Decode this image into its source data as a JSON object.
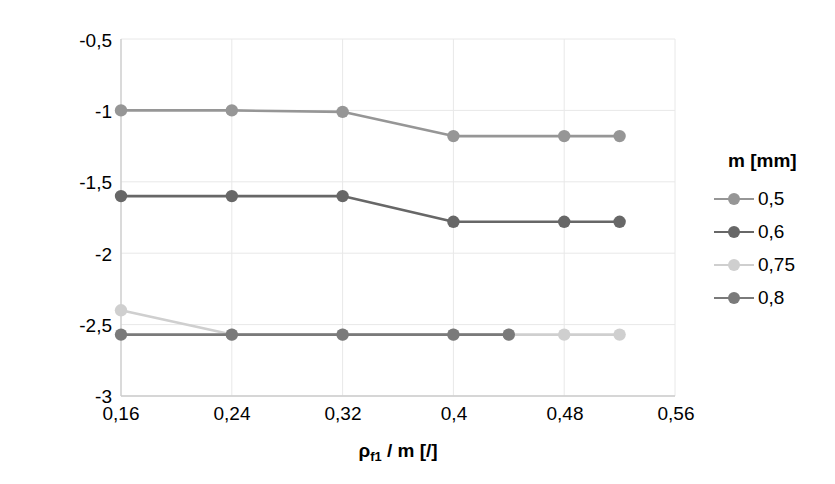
{
  "chart_data": {
    "type": "line",
    "title": "",
    "xlabel": "ρf1 / m [/]",
    "ylabel": "zσGEHMax - zNK [mm]",
    "xlabel_parts": {
      "rho": "ρ",
      "sub": "f1",
      "rest": " / m [/]"
    },
    "ylabel_parts": {
      "z1": "z",
      "sub1": "σGEHMax",
      "dash": " - ",
      "z2": "z",
      "sub2": "NK",
      "unit": " [mm]"
    },
    "xlim": [
      0.16,
      0.56
    ],
    "ylim": [
      -3,
      -0.5
    ],
    "xticks": [
      "0,16",
      "0,24",
      "0,32",
      "0,4",
      "0,48",
      "0,56"
    ],
    "xtick_values": [
      0.16,
      0.24,
      0.32,
      0.4,
      0.48,
      0.56
    ],
    "yticks": [
      "-0,5",
      "-1",
      "-1,5",
      "-2",
      "-2,5",
      "-3"
    ],
    "ytick_values": [
      -0.5,
      -1,
      -1.5,
      -2,
      -2.5,
      -3
    ],
    "grid": true,
    "legend_position": "right",
    "legend_title": "m [mm]",
    "series": [
      {
        "name": "0,5",
        "color": "#969696",
        "x": [
          0.16,
          0.24,
          0.32,
          0.4,
          0.48,
          0.52
        ],
        "values": [
          -1.0,
          -1.0,
          -1.01,
          -1.18,
          -1.18,
          -1.18
        ]
      },
      {
        "name": "0,6",
        "color": "#676767",
        "x": [
          0.16,
          0.24,
          0.32,
          0.4,
          0.48,
          0.52
        ],
        "values": [
          -1.6,
          -1.6,
          -1.6,
          -1.78,
          -1.78,
          -1.78
        ]
      },
      {
        "name": "0,75",
        "color": "#cfcfcf",
        "x": [
          0.16,
          0.24,
          0.32,
          0.4,
          0.44,
          0.48,
          0.52
        ],
        "values": [
          -2.4,
          -2.57,
          -2.57,
          -2.57,
          -2.57,
          -2.57,
          -2.57
        ]
      },
      {
        "name": "0,8",
        "color": "#7a7a7a",
        "x": [
          0.16,
          0.24,
          0.32,
          0.4,
          0.44
        ],
        "values": [
          -2.57,
          -2.57,
          -2.57,
          -2.57,
          -2.57
        ]
      }
    ]
  },
  "style": {
    "axis_color": "#cccccc",
    "grid_color": "#e8e8e8",
    "text_color": "#000000",
    "background": "#ffffff"
  }
}
